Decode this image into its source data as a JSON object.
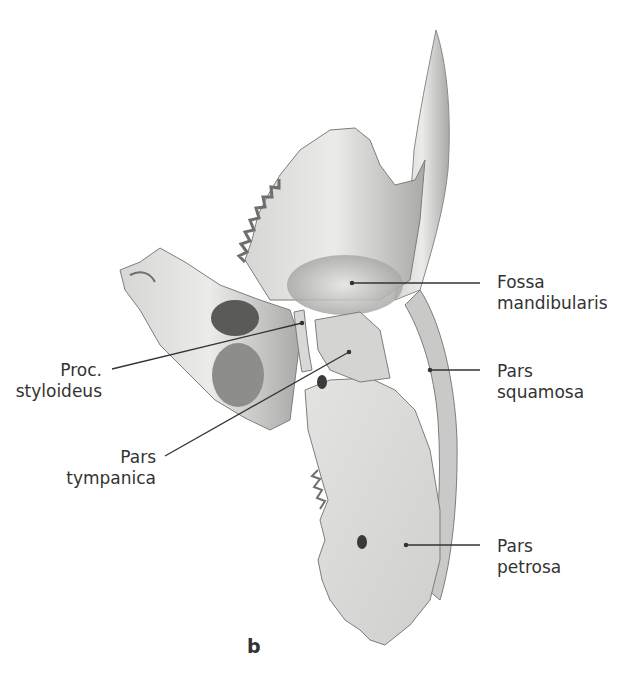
{
  "figure": {
    "panel_letter": "b",
    "colors": {
      "bone_light": "#e8e8e6",
      "bone_mid": "#bdbdbb",
      "bone_dark": "#6e6e6c",
      "leader": "#333333",
      "text": "#333333"
    }
  },
  "labels": [
    {
      "id": "fossa-mandibularis",
      "lines": [
        "Fossa",
        "mandibularis"
      ],
      "side": "right"
    },
    {
      "id": "pars-squamosa",
      "lines": [
        "Pars",
        "squamosa"
      ],
      "side": "right"
    },
    {
      "id": "pars-petrosa",
      "lines": [
        "Pars",
        "petrosa"
      ],
      "side": "right"
    },
    {
      "id": "proc-styloideus",
      "lines": [
        "Proc.",
        "styloideus"
      ],
      "side": "left"
    },
    {
      "id": "pars-tympanica",
      "lines": [
        "Pars",
        "tympanica"
      ],
      "side": "left"
    }
  ]
}
